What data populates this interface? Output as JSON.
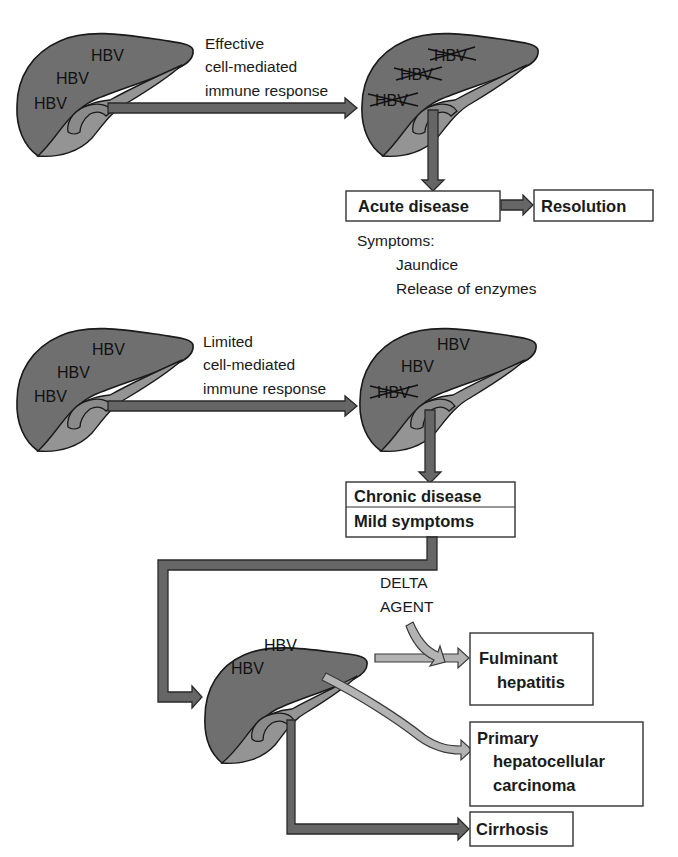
{
  "colors": {
    "liver_fill": "#6f6f6f",
    "liver_lobe": "#949494",
    "dark_arrow": "#666666",
    "light_arrow": "#b3b3b3",
    "outline": "#1a1a1a",
    "background": "#ffffff"
  },
  "top_scenario": {
    "liver_before": {
      "labels": [
        "HBV",
        "HBV",
        "HBV"
      ],
      "crossed": false
    },
    "response_lines": [
      "Effective",
      "cell-mediated",
      "immune response"
    ],
    "liver_after": {
      "labels": [
        "HBV",
        "HBV",
        "HBV"
      ],
      "crossed": [
        true,
        true,
        true
      ]
    },
    "acute_box": "Acute disease",
    "resolution_box": "Resolution",
    "symptoms_title": "Symptoms:",
    "symptoms": [
      "Jaundice",
      "Release of enzymes"
    ]
  },
  "bottom_scenario": {
    "liver_before": {
      "labels": [
        "HBV",
        "HBV",
        "HBV"
      ],
      "crossed": false
    },
    "response_lines": [
      "Limited",
      "cell-mediated",
      "immune response"
    ],
    "liver_after": {
      "labels": [
        "HBV",
        "HBV",
        "HBV"
      ],
      "crossed": [
        false,
        false,
        true
      ]
    },
    "chronic_box": [
      "Chronic disease",
      "Mild symptoms"
    ],
    "chronic_liver": {
      "labels": [
        "HBV",
        "HBV"
      ]
    },
    "delta_agent": [
      "DELTA",
      "AGENT"
    ],
    "outcomes": {
      "fulminant": [
        "Fulminant",
        "hepatitis"
      ],
      "carcinoma": [
        "Primary",
        "hepatocellular",
        "carcinoma"
      ],
      "cirrhosis": "Cirrhosis"
    }
  }
}
